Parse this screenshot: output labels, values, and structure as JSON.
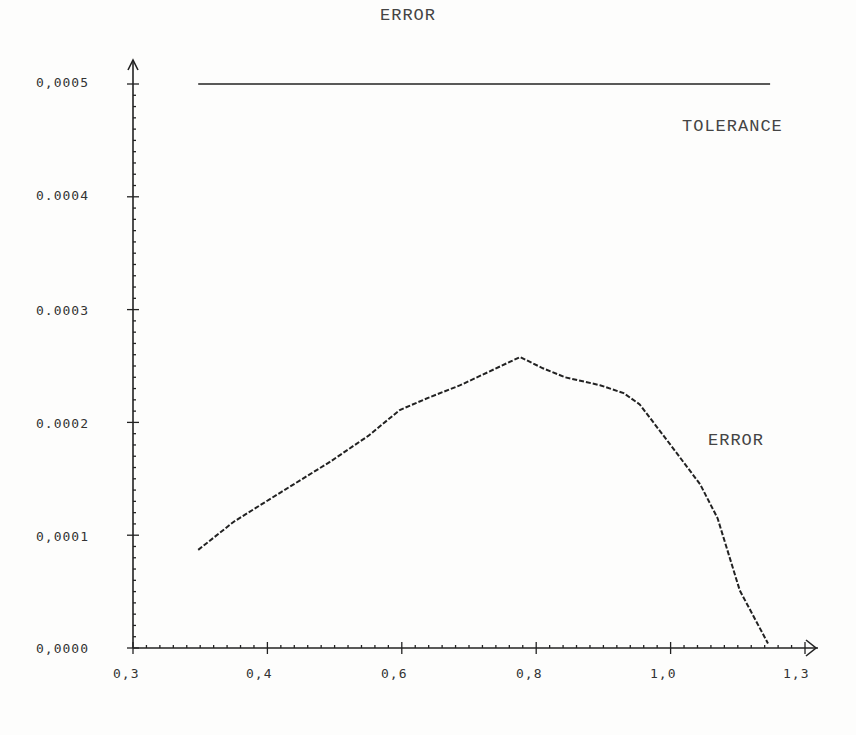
{
  "chart_data": {
    "type": "line",
    "title": "ERROR",
    "xlabel": "",
    "ylabel": "",
    "xlim": [
      0.3,
      1.3
    ],
    "ylim": [
      0.0,
      0.0005
    ],
    "x_tick_labels": [
      "0,3",
      "0,4",
      "0,6",
      "0,8",
      "1,0",
      "1,3"
    ],
    "y_tick_labels": [
      "0,0000",
      "0,0001",
      "0.0002",
      "0.0003",
      "0.0004",
      "0,0005"
    ],
    "grid": false,
    "legend": "none (inline annotations)",
    "annotations": [
      "ERROR",
      "TOLERANCE"
    ],
    "series": [
      {
        "name": "ERROR",
        "style": "dotted",
        "x": [
          0.397,
          0.45,
          0.52,
          0.593,
          0.65,
          0.697,
          0.74,
          0.787,
          0.83,
          0.876,
          0.91,
          0.943,
          0.995,
          1.03,
          1.054,
          1.1,
          1.144,
          1.17,
          1.203,
          1.245
        ],
        "y": [
          8.7e-05,
          0.000112,
          0.000138,
          0.000165,
          0.000188,
          0.000211,
          0.000222,
          0.000233,
          0.000245,
          0.000258,
          0.000248,
          0.00024,
          0.000233,
          0.000226,
          0.000216,
          0.00018,
          0.000145,
          0.000115,
          5.1e-05,
          4e-06
        ]
      },
      {
        "name": "TOLERANCE",
        "style": "solid",
        "x": [
          0.397,
          1.248
        ],
        "y": [
          0.0005,
          0.0005
        ]
      }
    ]
  },
  "labels": {
    "title": "ERROR",
    "tolerance": "TOLERANCE",
    "error_curve": "ERROR"
  },
  "axes": {
    "x_ticks": [
      "0,3",
      "0,4",
      "0,6",
      "0,8",
      "1,0",
      "1,3"
    ],
    "y_ticks": [
      "0,0000",
      "0,0001",
      "0.0002",
      "0.0003",
      "0.0004",
      "0,0005"
    ]
  }
}
